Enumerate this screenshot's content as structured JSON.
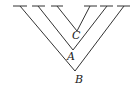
{
  "diagram": {
    "type": "nested-v-tree",
    "line_color": "#333333",
    "labels": {
      "inner": "C",
      "middle": "A",
      "outer": "B"
    },
    "branches": [
      {
        "name": "outer",
        "label": "B",
        "left_top": [
          20,
          6
        ],
        "vertex": [
          75,
          71
        ],
        "right_top": [
          124,
          6
        ]
      },
      {
        "name": "middle",
        "label": "A",
        "left_top": [
          38,
          6
        ],
        "vertex": [
          73,
          50
        ],
        "right_top": [
          107,
          6
        ]
      },
      {
        "name": "inner",
        "label": "C",
        "left_top": [
          57,
          6
        ],
        "vertex": [
          77,
          31
        ],
        "right_top": [
          90,
          6
        ]
      }
    ],
    "ticks": [
      {
        "x1": 13,
        "x2": 27,
        "y": 6
      },
      {
        "x1": 32,
        "x2": 45,
        "y": 6
      },
      {
        "x1": 51,
        "x2": 63,
        "y": 6
      },
      {
        "x1": 84,
        "x2": 97,
        "y": 6
      },
      {
        "x1": 100,
        "x2": 113,
        "y": 6
      },
      {
        "x1": 117,
        "x2": 130,
        "y": 6
      }
    ]
  }
}
